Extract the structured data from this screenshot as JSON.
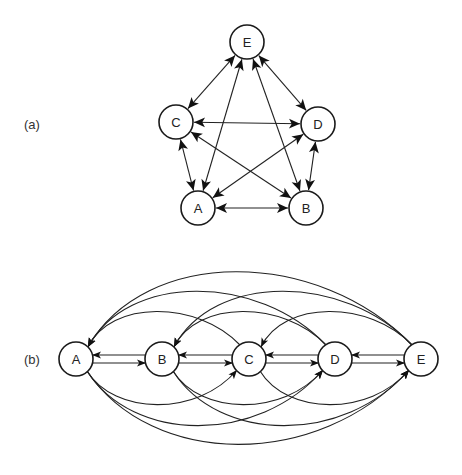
{
  "panels": [
    {
      "id": "a",
      "label": "(a)",
      "layout": "pentagon",
      "nodes": [
        "A",
        "B",
        "C",
        "D",
        "E"
      ],
      "edges": [
        {
          "from": "A",
          "to": "B",
          "bidirectional": true
        },
        {
          "from": "A",
          "to": "C",
          "bidirectional": true
        },
        {
          "from": "A",
          "to": "D",
          "bidirectional": true
        },
        {
          "from": "A",
          "to": "E",
          "bidirectional": true
        },
        {
          "from": "B",
          "to": "C",
          "bidirectional": true
        },
        {
          "from": "B",
          "to": "D",
          "bidirectional": true
        },
        {
          "from": "B",
          "to": "E",
          "bidirectional": true
        },
        {
          "from": "C",
          "to": "D",
          "bidirectional": true
        },
        {
          "from": "C",
          "to": "E",
          "bidirectional": true
        },
        {
          "from": "D",
          "to": "E",
          "bidirectional": true
        }
      ]
    },
    {
      "id": "b",
      "label": "(b)",
      "layout": "linear",
      "nodes": [
        "A",
        "B",
        "C",
        "D",
        "E"
      ],
      "edges": [
        {
          "from": "A",
          "to": "B"
        },
        {
          "from": "B",
          "to": "A"
        },
        {
          "from": "B",
          "to": "C"
        },
        {
          "from": "C",
          "to": "B"
        },
        {
          "from": "C",
          "to": "D"
        },
        {
          "from": "D",
          "to": "C"
        },
        {
          "from": "D",
          "to": "E"
        },
        {
          "from": "E",
          "to": "D"
        },
        {
          "from": "A",
          "to": "C"
        },
        {
          "from": "C",
          "to": "A"
        },
        {
          "from": "B",
          "to": "D"
        },
        {
          "from": "D",
          "to": "B"
        },
        {
          "from": "C",
          "to": "E"
        },
        {
          "from": "E",
          "to": "C"
        },
        {
          "from": "A",
          "to": "D"
        },
        {
          "from": "D",
          "to": "A"
        },
        {
          "from": "B",
          "to": "E"
        },
        {
          "from": "E",
          "to": "B"
        },
        {
          "from": "A",
          "to": "E"
        },
        {
          "from": "E",
          "to": "A"
        }
      ]
    }
  ]
}
